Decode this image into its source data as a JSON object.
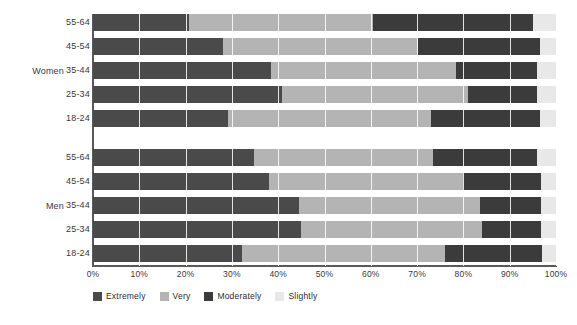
{
  "chart_data": {
    "type": "bar",
    "orientation": "horizontal",
    "stacked": true,
    "stacked_percent": true,
    "title": "",
    "xlabel": "",
    "ylabel": "",
    "xlim": [
      0,
      100
    ],
    "xticks": [
      "0%",
      "10%",
      "20%",
      "30%",
      "40%",
      "50%",
      "60%",
      "70%",
      "80%",
      "90%",
      "100%"
    ],
    "xtick_values": [
      0,
      10,
      20,
      30,
      40,
      50,
      60,
      70,
      80,
      90,
      100
    ],
    "grid": true,
    "legend_position": "bottom-left",
    "legend": [
      "Extremely",
      "Very",
      "Moderately",
      "Slightly"
    ],
    "series": [
      {
        "name": "Extremely",
        "color": "#4a4a4a"
      },
      {
        "name": "Very",
        "color": "#b4b4b4"
      },
      {
        "name": "Moderately",
        "color": "#3b3b3b"
      },
      {
        "name": "Slightly",
        "color": "#e8e8e8"
      }
    ],
    "groups": [
      {
        "label": "Women",
        "categories": [
          "55-64",
          "45-54",
          "35-44",
          "25-34",
          "18-24"
        ],
        "rows": [
          {
            "category": "55-64",
            "values": [
              20.7,
              39.8,
              34.5,
              5.0
            ]
          },
          {
            "category": "45-54",
            "values": [
              28.1,
              42.1,
              26.3,
              3.5
            ]
          },
          {
            "category": "35-44",
            "values": [
              38.4,
              40.0,
              17.6,
              4.0
            ]
          },
          {
            "category": "25-34",
            "values": [
              40.8,
              40.2,
              15.0,
              4.0
            ]
          },
          {
            "category": "18-24",
            "values": [
              29.2,
              43.8,
              23.5,
              3.5
            ]
          }
        ]
      },
      {
        "label": "Men",
        "categories": [
          "55-64",
          "45-54",
          "35-44",
          "25-34",
          "18-24"
        ],
        "rows": [
          {
            "category": "55-64",
            "values": [
              34.8,
              38.6,
              22.6,
              4.0
            ]
          },
          {
            "category": "45-54",
            "values": [
              38.0,
              42.0,
              16.7,
              3.3
            ]
          },
          {
            "category": "35-44",
            "values": [
              44.5,
              39.1,
              13.2,
              3.2
            ]
          },
          {
            "category": "25-34",
            "values": [
              45.0,
              39.0,
              12.8,
              3.2
            ]
          },
          {
            "category": "18-24",
            "values": [
              32.2,
              43.8,
              21.0,
              3.0
            ]
          }
        ]
      }
    ]
  },
  "axis": {
    "group_women": "Women",
    "group_men": "Men"
  },
  "colors": {
    "extremely": "#4a4a4a",
    "very": "#b4b4b4",
    "moderately": "#3b3b3b",
    "slightly": "#e8e8e8",
    "axis": "#5a5a5a",
    "text": "#3a3a3a",
    "background": "#ffffff"
  }
}
